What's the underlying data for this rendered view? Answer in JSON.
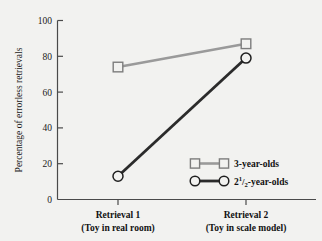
{
  "chart_data": {
    "type": "line",
    "title": "",
    "xlabel": "",
    "ylabel": "Percentage of errorless retrievals",
    "ylim": [
      0,
      100
    ],
    "yticks": [
      0,
      20,
      40,
      60,
      80,
      100
    ],
    "ytick_labels": [
      "0",
      "20",
      "40",
      "60",
      "80",
      "100"
    ],
    "grid": false,
    "legend_position": "inside-lower-right",
    "categories": [
      "Retrieval 1",
      "Retrieval 2"
    ],
    "category_sublabels": [
      "(Toy in real room)",
      "(Toy in scale model)"
    ],
    "series": [
      {
        "name": "3-year-olds",
        "values": [
          74,
          87
        ],
        "color": "#9a9a9a",
        "marker": "square"
      },
      {
        "name": "2¹/₂-year-olds",
        "name_parts": {
          "whole": "2",
          "numerator": "1",
          "denominator": "2",
          "suffix": "-year-olds"
        },
        "values": [
          13,
          79
        ],
        "color": "#2b2b2b",
        "marker": "circle"
      }
    ]
  },
  "legend": {
    "entries": [
      {
        "label": "3-year-olds",
        "marker": "square",
        "color": "#9a9a9a"
      },
      {
        "label_whole": "2",
        "label_numerator": "1",
        "label_denominator": "2",
        "label_suffix": "-year-olds",
        "marker": "circle",
        "color": "#2b2b2b"
      }
    ]
  },
  "axes": {
    "y_title": "Percentage of errorless retrievals",
    "y_tick_0": "0",
    "y_tick_20": "20",
    "y_tick_40": "40",
    "y_tick_60": "60",
    "y_tick_80": "80",
    "y_tick_100": "100",
    "x_cat_1_main": "Retrieval 1",
    "x_cat_1_sub": "(Toy in real room)",
    "x_cat_2_main": "Retrieval 2",
    "x_cat_2_sub": "(Toy in scale model)"
  }
}
